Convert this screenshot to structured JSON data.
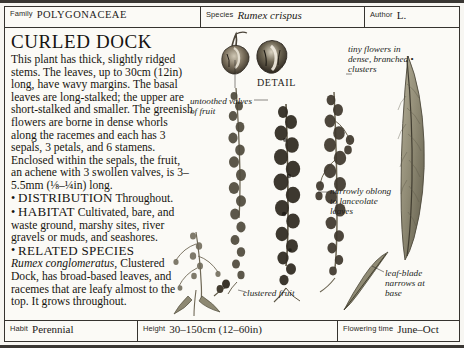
{
  "header": {
    "family": {
      "label": "Family",
      "value": "POLYGONACEAE"
    },
    "species": {
      "label": "Species",
      "value": "Rumex crispus"
    },
    "author": {
      "label": "Author",
      "value": "L."
    }
  },
  "article": {
    "title": "CURLED DOCK",
    "description": "This plant has thick, slightly ridged stems. The leaves, up to 30cm (12in) long, have wavy margins. The basal leaves are long-stalked; the upper are short-stalked and smaller. The greenish flowers are borne in dense whorls along the racemes and each has 3 sepals, 3 petals, and 6 stamens. Enclosed within the sepals, the fruit, an achene with 3 swollen valves, is 3–5.5mm (⅛–¼in) long.",
    "sections": [
      {
        "bullet": "•",
        "heading": "DISTRIBUTION",
        "text": "Throughout."
      },
      {
        "bullet": "•",
        "heading": "HABITAT",
        "text": "Cultivated, bare, and waste ground, marshy sites, river gravels or muds, and seashores."
      },
      {
        "bullet": "•",
        "heading": "RELATED SPECIES",
        "italic_lead": "Rumex conglomeratus",
        "text": ", Clustered Dock, has broad-based leaves, and racemes that are leafy almost to the top. It grows throughout."
      }
    ]
  },
  "annotations": {
    "detail_caption": "DETAIL",
    "untoothed": "untoothed valves of fruit",
    "tiny_flowers": "tiny flowers in dense, branched",
    "tiny_flowers_last": "clusters",
    "narrowly_oblong": "narrowly oblong to lanceolate leaves",
    "leaf_blade": "leaf-blade narrows at base",
    "clustered_fruit": "clustered fruit"
  },
  "footer": {
    "habit": {
      "label": "Habit",
      "value": "Perennial"
    },
    "height": {
      "label": "Height",
      "value": "30–150cm (12–60in)"
    },
    "flowering": {
      "label": "Flowering time",
      "value": "June–Oct"
    }
  },
  "colors": {
    "rule": "#36332f",
    "page": "#fbfaf6",
    "ink": "#17150f",
    "plant_dark": "#4a4338",
    "plant_mid": "#6f6555",
    "plant_light": "#9a907c",
    "leaf_green": "#7d7a62"
  }
}
